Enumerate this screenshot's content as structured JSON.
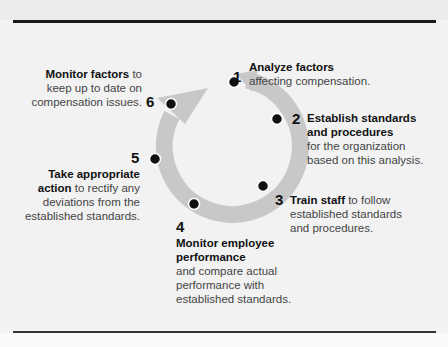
{
  "diagram": {
    "type": "cycle",
    "ring_color": "#c8c8c8",
    "dot_color": "#111111",
    "steps": [
      {
        "number": "1",
        "title": "Analyze factors",
        "body": "affecting compensation."
      },
      {
        "number": "2",
        "title": "Establish standards",
        "title2": "and procedures",
        "body": "for the organization",
        "body2": "based on this analysis."
      },
      {
        "number": "3",
        "title": "Train staff",
        "body_inline": " to follow",
        "body": "established standards",
        "body2": "and procedures."
      },
      {
        "number": "4",
        "title": "Monitor employee",
        "title2": "performance",
        "body": "and compare actual",
        "body2": "performance with",
        "body3": "established standards."
      },
      {
        "number": "5",
        "title": "Take appropriate",
        "title2": "action",
        "body_inline": " to rectify any",
        "body": "deviations from the",
        "body2": "established standards."
      },
      {
        "number": "6",
        "title": "Monitor factors",
        "body_inline": " to",
        "body": "keep up to date on",
        "body2": "compensation issues."
      }
    ]
  }
}
